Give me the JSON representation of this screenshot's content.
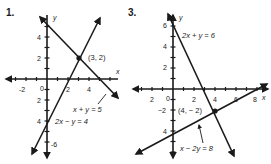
{
  "problems": [
    {
      "number": "1.",
      "axis_labels": {
        "x": "x",
        "y": "y"
      },
      "x_ticks": [
        "-2",
        "0",
        "2",
        "4"
      ],
      "y_ticks": [
        "4",
        "2",
        "2",
        "4",
        "-6"
      ],
      "intersection": {
        "label": "(3, 2)",
        "x": 3,
        "y": 2
      },
      "lines": [
        {
          "equation": "x + y = 5"
        },
        {
          "equation": "2x − y = 4"
        }
      ]
    },
    {
      "number": "3.",
      "axis_labels": {
        "x": "x",
        "y": "y"
      },
      "x_ticks": [
        "2",
        "0",
        "2",
        "4",
        "6",
        "8"
      ],
      "y_ticks": [
        "6",
        "4",
        "2",
        "−2",
        "4"
      ],
      "intersection": {
        "label": "(4, − 2)",
        "x": 4,
        "y": -2
      },
      "lines": [
        {
          "equation": "2x + y = 6"
        },
        {
          "equation": "x − 2y = 8"
        }
      ]
    }
  ],
  "colors": {
    "ink": "#1a1a1a",
    "background": "#ffffff"
  }
}
